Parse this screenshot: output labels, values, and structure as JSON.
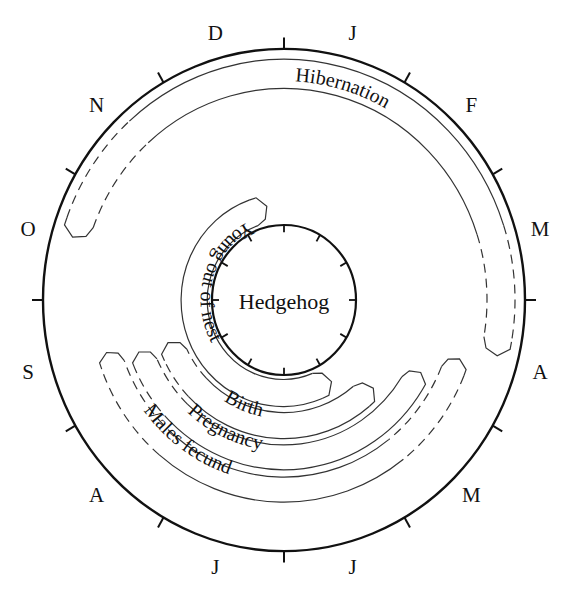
{
  "diagram": {
    "title": "Hedgehog",
    "type": "annual-cycle-clock",
    "colors": {
      "ink": "#111111",
      "band_line": "#333333",
      "background": "#ffffff"
    },
    "months_clockwise_from_top": [
      "J",
      "F",
      "M",
      "A",
      "M",
      "J",
      "J",
      "A",
      "S",
      "O",
      "N",
      "D"
    ],
    "month_labels": [
      {
        "label": "J",
        "angle": 15
      },
      {
        "label": "F",
        "angle": 45
      },
      {
        "label": "M",
        "angle": 75
      },
      {
        "label": "A",
        "angle": 105
      },
      {
        "label": "M",
        "angle": 135
      },
      {
        "label": "J",
        "angle": 165
      },
      {
        "label": "J",
        "angle": 195
      },
      {
        "label": "A",
        "angle": 225
      },
      {
        "label": "S",
        "angle": 255
      },
      {
        "label": "O",
        "angle": 285
      },
      {
        "label": "N",
        "angle": 315
      },
      {
        "label": "D",
        "angle": 345
      }
    ],
    "bands": [
      {
        "id": "hibernation",
        "label": "Hibernation",
        "start_month": "O (mid)",
        "end_month": "A (early)",
        "dashed_start": true,
        "dashed_end": true
      },
      {
        "id": "young-out-of-nest",
        "label": "Young out of nest",
        "start_month": "J (late)",
        "end_month": "D",
        "dashed_start": false,
        "dashed_end": false
      },
      {
        "id": "birth",
        "label": "Birth",
        "start_month": "M (late)",
        "end_month": "S",
        "dashed_start": false,
        "dashed_end": true
      },
      {
        "id": "pregnancy",
        "label": "Pregnancy",
        "start_month": "A (late)",
        "end_month": "S",
        "dashed_start": false,
        "dashed_end": true
      },
      {
        "id": "males-fecund",
        "label": "Males fecund",
        "start_month": "A (mid)",
        "end_month": "S",
        "dashed_start": true,
        "dashed_end": true
      }
    ]
  }
}
